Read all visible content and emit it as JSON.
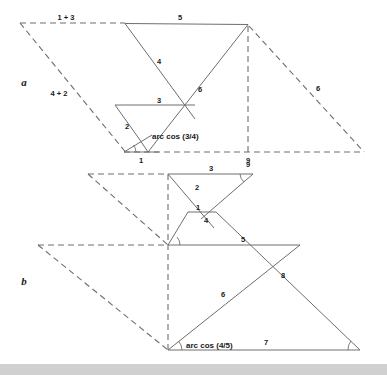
{
  "figure": {
    "type": "geometric-diagram",
    "background_color": "#ffffff",
    "stroke_color": "#6e6e6e",
    "text_color": "#1a1a1a",
    "bottom_bar_color": "#d0d0d0",
    "panels": [
      {
        "id": "a",
        "label": "a",
        "label_pos": {
          "x": 24,
          "y": 86
        },
        "angle_annotation": "arc cos (3/4)",
        "dashed_edge_labels": [
          "1 + 3",
          "4 + 2"
        ],
        "solid_edge_labels": [
          "5",
          "4",
          "6",
          "3",
          "2",
          "1",
          "9",
          "6"
        ]
      },
      {
        "id": "b",
        "label": "b",
        "label_pos": {
          "x": 24,
          "y": 285
        },
        "angle_annotation": "arc cos (4/5)",
        "solid_edge_labels": [
          "3",
          "9",
          "2",
          "1",
          "4",
          "5",
          "8",
          "6",
          "7"
        ]
      }
    ],
    "labels_a": {
      "top_dashed": "1 + 3",
      "left_dashed": "4 + 2",
      "top_solid": "5",
      "diag_long": "4",
      "diag_right": "6",
      "mid_horizontal": "3",
      "small_left": "2",
      "base_small": "1",
      "base_corner": "9",
      "right_dashed": "6",
      "panel": "a",
      "arccos": "arc cos (3/4)"
    },
    "labels_b": {
      "top": "3",
      "top_right_corner": "9",
      "upper_left_diag": "2",
      "tiny_horizontal": "1",
      "tiny_under": "4",
      "mid_horizontal": "5",
      "right_diag": "8",
      "lower_diag": "6",
      "base": "7",
      "panel": "b",
      "arccos": "arc cos (4/5)"
    },
    "geometry_a": {
      "dashed_top": [
        [
          20,
          23
        ],
        [
          125,
          23
        ]
      ],
      "dashed_left_diagonal": [
        [
          20,
          23
        ],
        [
          125,
          152
        ]
      ],
      "dashed_base": [
        [
          125,
          152
        ],
        [
          364,
          152
        ]
      ],
      "dashed_right_diagonal": [
        [
          248,
          25
        ],
        [
          364,
          152
        ]
      ],
      "dashed_vertical": [
        [
          248,
          25
        ],
        [
          248,
          152
        ]
      ],
      "solid_top": [
        [
          125,
          23
        ],
        [
          248,
          25
        ]
      ],
      "solid_diag_down": [
        [
          125,
          23
        ],
        [
          194,
          118
        ]
      ],
      "solid_diag_up": [
        [
          194,
          118
        ],
        [
          248,
          25
        ]
      ],
      "solid_mid_horizontal": [
        [
          115,
          105
        ],
        [
          194,
          105
        ]
      ],
      "solid_small_left": [
        [
          115,
          105
        ],
        [
          148,
          152
        ]
      ],
      "solid_base": [
        [
          124,
          152
        ],
        [
          148,
          152
        ]
      ],
      "solid_tiny_diag": [
        [
          124,
          152
        ],
        [
          140,
          133
        ]
      ]
    },
    "geometry_b": {
      "dashed_upper_top": [
        [
          88,
          174
        ],
        [
          168,
          174
        ]
      ],
      "dashed_upper_diag": [
        [
          88,
          174
        ],
        [
          168,
          245
        ]
      ],
      "dashed_mid_horizontal": [
        [
          38,
          245
        ],
        [
          168,
          245
        ]
      ],
      "dashed_lower_diag": [
        [
          38,
          245
        ],
        [
          168,
          350
        ]
      ],
      "dashed_vertical": [
        [
          168,
          174
        ],
        [
          168,
          350
        ]
      ],
      "solid_top": [
        [
          168,
          174
        ],
        [
          253,
          174
        ]
      ],
      "solid_diag_a": [
        [
          168,
          174
        ],
        [
          213,
          227
        ]
      ],
      "solid_diag_b": [
        [
          213,
          227
        ],
        [
          253,
          174
        ]
      ],
      "solid_tiny_horizontal": [
        [
          188,
          212
        ],
        [
          216,
          212
        ]
      ],
      "solid_mid_horizontal": [
        [
          168,
          245
        ],
        [
          300,
          245
        ]
      ],
      "solid_mid_diag": [
        [
          188,
          212
        ],
        [
          168,
          245
        ]
      ],
      "solid_long_diag": [
        [
          168,
          350
        ],
        [
          300,
          245
        ]
      ],
      "solid_right_diag": [
        [
          300,
          245
        ],
        [
          360,
          350
        ]
      ],
      "solid_base": [
        [
          168,
          350
        ],
        [
          360,
          350
        ]
      ]
    }
  }
}
